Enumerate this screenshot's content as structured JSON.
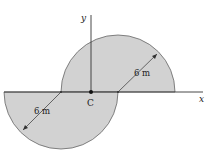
{
  "diagram": {
    "axes": {
      "x_label": "x",
      "y_label": "y"
    },
    "centroid_label": "C",
    "dimensions": [
      {
        "label": "6 m",
        "refers_to": "upper semicircle radius"
      },
      {
        "label": "6 m",
        "refers_to": "lower semicircle radius"
      }
    ],
    "colors": {
      "fill": "#d2d2d2",
      "stroke": "#555555",
      "axis": "#333333"
    }
  }
}
